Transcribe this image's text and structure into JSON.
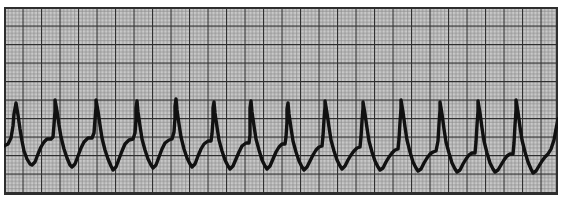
{
  "document": {
    "title": "ECG Rhythm Strip",
    "type": "electrocardiogram-tracing",
    "description": "Single-lead ECG rhythm strip printed on standard pink/grey ECG graph paper showing a rapid, regular wide-complex tachycardia with sawtooth-like undulating baseline.",
    "interpretation": "Rapid regular wide-complex tachycardia (sawtooth undulating morphology)"
  },
  "paper": {
    "background_color": "#c9c9c9",
    "minor_line_color": "#8a8a8a",
    "major_line_color": "#2e2e2e",
    "border_color": "#2e2e2e",
    "minor_grid_px": 3.7,
    "major_grid_px": 18.5,
    "minor_per_major": 5,
    "small_box_sec": 0.04,
    "large_box_sec": 0.2,
    "small_box_mv": 0.1,
    "large_box_mv": 0.5,
    "paper_speed_label": "25 mm/s",
    "gain_label": "10 mm/mV"
  },
  "trace": {
    "color": "#111111",
    "line_width": 3.4,
    "baseline_y": 136,
    "peak_y": 92,
    "trough_y": 160,
    "beat_count": 14,
    "mean_rr_px": 38.5
  },
  "chart_data": {
    "type": "line",
    "subtitle": "Rapid regular wide-complex tachycardia",
    "xlabel": "Time",
    "ylabel": "Amplitude (mV)",
    "grid": true,
    "legend": "none",
    "xlim": [
      0,
      554
    ],
    "ylim": [
      188,
      0
    ],
    "series": [
      {
        "name": "ECG lead",
        "color": "#111111",
        "beats": [
          {
            "index": 1,
            "r_peak_x": 12,
            "r_peak_y": 96,
            "s_trough_x": 28,
            "s_trough_y": 158,
            "t_hump_x": 42,
            "t_hump_y": 132
          },
          {
            "index": 2,
            "r_peak_x": 51,
            "r_peak_y": 93,
            "s_trough_x": 66,
            "s_trough_y": 160,
            "t_hump_x": 80,
            "t_hump_y": 131
          },
          {
            "index": 3,
            "r_peak_x": 92,
            "r_peak_y": 93,
            "s_trough_x": 108,
            "s_trough_y": 163,
            "t_hump_x": 122,
            "t_hump_y": 132
          },
          {
            "index": 4,
            "r_peak_x": 132,
            "r_peak_y": 94,
            "s_trough_x": 148,
            "s_trough_y": 161,
            "t_hump_x": 162,
            "t_hump_y": 132
          },
          {
            "index": 5,
            "r_peak_x": 171,
            "r_peak_y": 92,
            "s_trough_x": 187,
            "s_trough_y": 160,
            "t_hump_x": 201,
            "t_hump_y": 133
          },
          {
            "index": 6,
            "r_peak_x": 209,
            "r_peak_y": 95,
            "s_trough_x": 224,
            "s_trough_y": 162,
            "t_hump_x": 238,
            "t_hump_y": 134
          },
          {
            "index": 7,
            "r_peak_x": 246,
            "r_peak_y": 94,
            "s_trough_x": 262,
            "s_trough_y": 162,
            "t_hump_x": 276,
            "t_hump_y": 136
          },
          {
            "index": 8,
            "r_peak_x": 283,
            "r_peak_y": 96,
            "s_trough_x": 299,
            "s_trough_y": 163,
            "t_hump_x": 312,
            "t_hump_y": 138
          },
          {
            "index": 9,
            "r_peak_x": 321,
            "r_peak_y": 94,
            "s_trough_x": 337,
            "s_trough_y": 162,
            "t_hump_x": 350,
            "t_hump_y": 140
          },
          {
            "index": 10,
            "r_peak_x": 359,
            "r_peak_y": 95,
            "s_trough_x": 375,
            "s_trough_y": 163,
            "t_hump_x": 388,
            "t_hump_y": 142
          },
          {
            "index": 11,
            "r_peak_x": 397,
            "r_peak_y": 93,
            "s_trough_x": 413,
            "s_trough_y": 164,
            "t_hump_x": 426,
            "t_hump_y": 144
          },
          {
            "index": 12,
            "r_peak_x": 436,
            "r_peak_y": 95,
            "s_trough_x": 452,
            "s_trough_y": 165,
            "t_hump_x": 465,
            "t_hump_y": 146
          },
          {
            "index": 13,
            "r_peak_x": 474,
            "r_peak_y": 94,
            "s_trough_x": 490,
            "s_trough_y": 165,
            "t_hump_x": 503,
            "t_hump_y": 147
          },
          {
            "index": 14,
            "r_peak_x": 512,
            "r_peak_y": 93,
            "s_trough_x": 528,
            "s_trough_y": 166,
            "t_hump_x": 541,
            "t_hump_y": 148
          }
        ],
        "path": "M 0,139 L 4,137 L 7,131 L 9,119 L 10,107 L 12,96 L 14,108 L 16,122 L 18,134 L 20,144 L 23,152 L 26,157 L 28,158 L 31,155 L 34,147 L 37,140 L 40,135 L 43,132 L 47,132 L 49,130 L 50,118 L 51,104 L 51,93 L 53,104 L 55,118 L 57,130 L 60,142 L 63,151 L 66,158 L 68,160 L 71,157 L 74,149 L 77,141 L 80,135 L 84,131 L 88,131 L 90,126 L 91,113 L 92,100 L 92,93 L 94,104 L 96,118 L 98,131 L 101,143 L 104,152 L 107,159 L 109,163 L 112,160 L 115,152 L 118,144 L 121,137 L 125,133 L 129,132 L 131,126 L 132,113 L 132,101 L 133,94 L 134,105 L 136,119 L 138,132 L 141,143 L 144,152 L 147,158 L 149,161 L 152,158 L 155,150 L 158,142 L 161,136 L 165,133 L 168,132 L 170,125 L 171,111 L 171,99 L 172,92 L 173,103 L 175,117 L 177,130 L 180,142 L 183,151 L 186,157 L 188,160 L 191,157 L 194,149 L 197,142 L 200,137 L 204,134 L 207,134 L 208,127 L 209,113 L 209,101 L 210,95 L 211,106 L 213,120 L 215,133 L 218,144 L 221,153 L 224,159 L 226,162 L 229,159 L 232,152 L 235,145 L 238,139 L 242,136 L 245,136 L 246,128 L 246,113 L 246,101 L 247,94 L 248,105 L 250,119 L 252,132 L 255,143 L 258,153 L 261,159 L 263,162 L 266,159 L 269,152 L 272,145 L 275,140 L 278,137 L 281,137 L 282,130 L 283,115 L 283,102 L 284,96 L 285,107 L 287,121 L 289,134 L 292,145 L 295,154 L 298,160 L 300,163 L 303,160 L 306,154 L 309,148 L 312,143 L 315,140 L 318,139 L 319,129 L 320,113 L 321,100 L 321,94 L 323,106 L 325,120 L 327,133 L 330,144 L 333,153 L 336,159 L 338,162 L 341,159 L 344,153 L 347,148 L 350,144 L 353,141 L 356,140 L 357,130 L 358,114 L 359,101 L 359,95 L 361,107 L 363,121 L 365,134 L 368,145 L 371,154 L 374,160 L 376,163 L 379,161 L 382,155 L 385,150 L 388,146 L 391,143 L 394,142 L 395,132 L 396,115 L 397,101 L 397,93 L 399,105 L 401,120 L 403,133 L 406,145 L 409,155 L 412,161 L 414,164 L 417,162 L 420,156 L 423,151 L 426,147 L 429,145 L 432,144 L 434,134 L 435,117 L 436,103 L 436,95 L 438,107 L 440,122 L 442,135 L 445,146 L 448,156 L 451,162 L 453,165 L 456,163 L 459,157 L 462,152 L 465,148 L 468,146 L 471,146 L 472,135 L 473,118 L 474,104 L 474,94 L 476,106 L 478,121 L 480,134 L 483,146 L 486,156 L 489,162 L 491,165 L 494,163 L 497,158 L 500,153 L 503,149 L 506,147 L 509,147 L 510,136 L 511,118 L 512,103 L 512,93 L 514,105 L 516,120 L 518,133 L 521,145 L 524,155 L 527,162 L 529,166 L 532,164 L 535,159 L 538,154 L 541,150 L 544,147 L 547,142 L 550,133 L 552,122 L 554,112"
      }
    ]
  }
}
